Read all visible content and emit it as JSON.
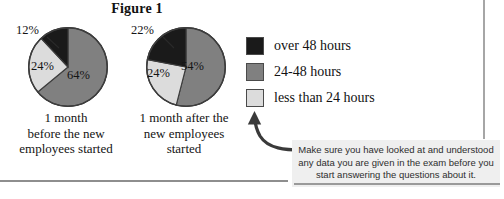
{
  "figure": {
    "title": "Figure 1"
  },
  "legend": {
    "items": [
      {
        "label": "over 48 hours",
        "color": "#1a1a1a",
        "key": "over48"
      },
      {
        "label": "24-48 hours",
        "color": "#808080",
        "key": "h24to48"
      },
      {
        "label": "less than 24 hours",
        "color": "#dcdcdc",
        "key": "under24"
      }
    ]
  },
  "annotation": {
    "text": "Make sure you have looked at and understood any data you are given in the exam before you start answering the questions about it.",
    "arrow": "curved-arrow-up-left"
  },
  "chart_data": [
    {
      "type": "pie",
      "title": "1 month before the new employees started",
      "caption_lines": [
        "1 month",
        "before the new",
        "employees started"
      ],
      "categories": [
        "24-48 hours",
        "less than 24 hours",
        "over 48 hours"
      ],
      "values": [
        64,
        24,
        12
      ],
      "labels": [
        "64%",
        "24%",
        "12%"
      ],
      "colors": [
        "#808080",
        "#dcdcdc",
        "#1a1a1a"
      ],
      "start_angle_deg": 0,
      "direction": "clockwise",
      "legend_position": "right-shared",
      "unit": "percent"
    },
    {
      "type": "pie",
      "title": "1 month after the new employees started",
      "caption_lines": [
        "1 month after the",
        "new employees",
        "started"
      ],
      "categories": [
        "24-48 hours",
        "less than 24 hours",
        "over 48 hours"
      ],
      "values": [
        54,
        24,
        22
      ],
      "labels": [
        "54%",
        "24%",
        "22%"
      ],
      "colors": [
        "#808080",
        "#dcdcdc",
        "#1a1a1a"
      ],
      "start_angle_deg": 0,
      "direction": "clockwise",
      "legend_position": "right-shared",
      "unit": "percent"
    }
  ]
}
